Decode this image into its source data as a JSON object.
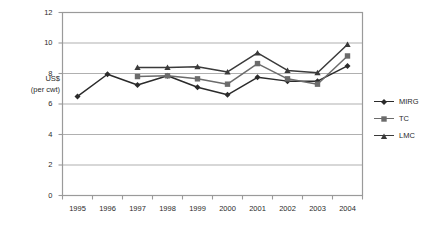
{
  "chart_data": {
    "type": "line",
    "title": "",
    "xlabel": "",
    "ylabel": "US$ (per cwt)",
    "ylabel_lines": [
      "US$",
      "(per cwt)"
    ],
    "categories": [
      "1995",
      "1996",
      "1997",
      "1998",
      "1999",
      "2000",
      "2001",
      "2002",
      "2003",
      "2004"
    ],
    "x": [
      1995,
      1996,
      1997,
      1998,
      1999,
      2000,
      2001,
      2002,
      2003,
      2004
    ],
    "ylim": [
      0,
      12
    ],
    "yticks": [
      0,
      2,
      4,
      6,
      8,
      10,
      12
    ],
    "ytick_labels": [
      "0",
      "2",
      "4",
      "6",
      "8",
      "10",
      "12"
    ],
    "grid": true,
    "grid_axis": "y",
    "legend_position": "right",
    "series": [
      {
        "name": "MIRG",
        "marker": "diamond",
        "color": "#2b2b2b",
        "values": [
          6.5,
          7.95,
          7.25,
          7.85,
          7.1,
          6.6,
          7.75,
          7.5,
          7.5,
          8.5
        ]
      },
      {
        "name": "TC",
        "marker": "square",
        "color": "#6b6b6b",
        "values": [
          null,
          null,
          7.8,
          7.85,
          7.65,
          7.3,
          8.65,
          7.65,
          7.3,
          9.15
        ]
      },
      {
        "name": "LMC",
        "marker": "triangle",
        "color": "#3a3a3a",
        "values": [
          null,
          null,
          8.4,
          8.4,
          8.45,
          8.1,
          9.35,
          8.2,
          8.05,
          9.9
        ]
      }
    ]
  },
  "legend": {
    "items": [
      {
        "label": "MIRG"
      },
      {
        "label": "TC"
      },
      {
        "label": "LMC"
      }
    ]
  },
  "colors": {
    "plot_border": "#9a9a9a",
    "gridline": "#b0b0b0",
    "text": "#2a2a2a",
    "background": "#ffffff"
  },
  "caption": {
    "text": ""
  }
}
